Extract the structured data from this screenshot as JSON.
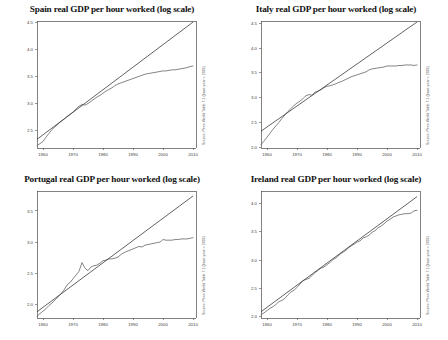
{
  "figure": {
    "layout": "2x2-panel-grid",
    "background": "#ffffff",
    "panel_count": 4
  },
  "chart_data": [
    {
      "type": "line",
      "title": "Spain real GDP per hour worked (log scale)",
      "xlabel": "",
      "ylabel": "",
      "grid": false,
      "legend_position": "none",
      "xlim": [
        1958,
        2011
      ],
      "ylim": [
        2.18,
        4.52
      ],
      "xticks": [
        1960,
        1970,
        1980,
        1990,
        2000,
        2010
      ],
      "xticklabels": [
        "1960",
        "1970",
        "1980",
        "1990",
        "2000",
        "2010"
      ],
      "yticks": [
        2.5,
        3.0,
        3.5,
        4.0,
        4.5
      ],
      "yticklabels": [
        "2.5",
        "3.0",
        "3.5",
        "4.0",
        "4.5"
      ],
      "annotation": "Source: Penn World Table 7.1 (base year = 2005)",
      "series": [
        {
          "name": "Actual log real GDP per hour worked",
          "x": [
            1958,
            1959,
            1960,
            1961,
            1962,
            1963,
            1964,
            1965,
            1966,
            1967,
            1968,
            1969,
            1970,
            1971,
            1972,
            1973,
            1974,
            1975,
            1976,
            1977,
            1978,
            1979,
            1980,
            1981,
            1982,
            1983,
            1984,
            1985,
            1986,
            1987,
            1988,
            1989,
            1990,
            1991,
            1992,
            1993,
            1994,
            1995,
            1996,
            1997,
            1998,
            1999,
            2000,
            2001,
            2002,
            2003,
            2004,
            2005,
            2006,
            2007,
            2008,
            2009,
            2010
          ],
          "values": [
            2.23,
            2.26,
            2.3,
            2.38,
            2.45,
            2.52,
            2.57,
            2.62,
            2.67,
            2.71,
            2.76,
            2.8,
            2.84,
            2.9,
            2.95,
            2.98,
            2.97,
            3.0,
            3.04,
            3.08,
            3.12,
            3.15,
            3.19,
            3.23,
            3.26,
            3.29,
            3.33,
            3.36,
            3.38,
            3.4,
            3.42,
            3.44,
            3.46,
            3.48,
            3.5,
            3.52,
            3.54,
            3.55,
            3.56,
            3.57,
            3.58,
            3.59,
            3.6,
            3.6,
            3.61,
            3.62,
            3.62,
            3.63,
            3.64,
            3.65,
            3.66,
            3.68,
            3.69
          ]
        },
        {
          "name": "Log-linear trend",
          "x": [
            1958,
            2010
          ],
          "values": [
            2.34,
            4.5
          ]
        }
      ]
    },
    {
      "type": "line",
      "title": "Italy real GDP per hour worked (log scale)",
      "xlabel": "",
      "ylabel": "",
      "grid": false,
      "legend_position": "none",
      "xlim": [
        1958,
        2011
      ],
      "ylim": [
        1.98,
        4.55
      ],
      "xticks": [
        1960,
        1970,
        1980,
        1990,
        2000,
        2010
      ],
      "xticklabels": [
        "1960",
        "1970",
        "1980",
        "1990",
        "2000",
        "2010"
      ],
      "yticks": [
        2.0,
        2.5,
        3.0,
        3.5,
        4.0,
        4.5
      ],
      "yticklabels": [
        "2.0",
        "2.5",
        "3.0",
        "3.5",
        "4.0",
        "4.5"
      ],
      "annotation": "Source: Penn World Table 7.1 (base year = 2005)",
      "series": [
        {
          "name": "Actual log real GDP per hour worked",
          "x": [
            1958,
            1959,
            1960,
            1961,
            1962,
            1963,
            1964,
            1965,
            1966,
            1967,
            1968,
            1969,
            1970,
            1971,
            1972,
            1973,
            1974,
            1975,
            1976,
            1977,
            1978,
            1979,
            1980,
            1981,
            1982,
            1983,
            1984,
            1985,
            1986,
            1987,
            1988,
            1989,
            1990,
            1991,
            1992,
            1993,
            1994,
            1995,
            1996,
            1997,
            1998,
            1999,
            2000,
            2001,
            2002,
            2003,
            2004,
            2005,
            2006,
            2007,
            2008,
            2009,
            2010
          ],
          "values": [
            2.05,
            2.12,
            2.2,
            2.28,
            2.36,
            2.43,
            2.5,
            2.58,
            2.65,
            2.72,
            2.78,
            2.84,
            2.89,
            2.93,
            2.98,
            3.04,
            3.06,
            3.05,
            3.11,
            3.13,
            3.16,
            3.2,
            3.23,
            3.24,
            3.26,
            3.28,
            3.31,
            3.33,
            3.36,
            3.39,
            3.42,
            3.44,
            3.46,
            3.48,
            3.5,
            3.52,
            3.56,
            3.58,
            3.59,
            3.6,
            3.61,
            3.62,
            3.64,
            3.64,
            3.64,
            3.64,
            3.65,
            3.65,
            3.66,
            3.66,
            3.66,
            3.65,
            3.66
          ]
        },
        {
          "name": "Log-linear trend",
          "x": [
            1958,
            2010
          ],
          "values": [
            2.32,
            4.53
          ]
        }
      ]
    },
    {
      "type": "line",
      "title": "Portugal real GDP per hour worked (log scale)",
      "xlabel": "",
      "ylabel": "",
      "grid": false,
      "legend_position": "none",
      "xlim": [
        1958,
        2011
      ],
      "ylim": [
        1.78,
        3.82
      ],
      "xticks": [
        1960,
        1970,
        1980,
        1990,
        2000,
        2010
      ],
      "xticklabels": [
        "1960",
        "1970",
        "1980",
        "1990",
        "2000",
        "2010"
      ],
      "yticks": [
        2.0,
        2.5,
        3.0,
        3.5
      ],
      "yticklabels": [
        "2.0",
        "2.5",
        "3.0",
        "3.5"
      ],
      "annotation": "Source: Penn World Table 7.1 (base year = 2005)",
      "series": [
        {
          "name": "Actual log real GDP per hour worked",
          "x": [
            1958,
            1959,
            1960,
            1961,
            1962,
            1963,
            1964,
            1965,
            1966,
            1967,
            1968,
            1969,
            1970,
            1971,
            1972,
            1973,
            1974,
            1975,
            1976,
            1977,
            1978,
            1979,
            1980,
            1981,
            1982,
            1983,
            1984,
            1985,
            1986,
            1987,
            1988,
            1989,
            1990,
            1991,
            1992,
            1993,
            1994,
            1995,
            1996,
            1997,
            1998,
            1999,
            2000,
            2001,
            2002,
            2003,
            2004,
            2005,
            2006,
            2007,
            2008,
            2009,
            2010
          ],
          "values": [
            1.81,
            1.85,
            1.89,
            1.93,
            1.98,
            2.02,
            2.07,
            2.12,
            2.17,
            2.23,
            2.31,
            2.35,
            2.41,
            2.47,
            2.53,
            2.67,
            2.58,
            2.54,
            2.6,
            2.62,
            2.63,
            2.66,
            2.7,
            2.71,
            2.73,
            2.73,
            2.74,
            2.76,
            2.8,
            2.83,
            2.85,
            2.87,
            2.89,
            2.91,
            2.93,
            2.92,
            2.95,
            2.96,
            2.97,
            2.98,
            2.99,
            3.0,
            3.04,
            3.03,
            3.03,
            3.03,
            3.04,
            3.04,
            3.05,
            3.05,
            3.05,
            3.06,
            3.07
          ]
        },
        {
          "name": "Log-linear trend",
          "x": [
            1958,
            2010
          ],
          "values": [
            1.88,
            3.74
          ]
        }
      ]
    },
    {
      "type": "line",
      "title": "Ireland real GDP per hour worked (log scale)",
      "xlabel": "",
      "ylabel": "",
      "grid": false,
      "legend_position": "none",
      "xlim": [
        1958,
        2011
      ],
      "ylim": [
        1.98,
        4.22
      ],
      "xticks": [
        1960,
        1970,
        1980,
        1990,
        2000,
        2010
      ],
      "xticklabels": [
        "1960",
        "1970",
        "1980",
        "1990",
        "2000",
        "2010"
      ],
      "yticks": [
        2.0,
        2.5,
        3.0,
        3.5,
        4.0
      ],
      "yticklabels": [
        "2.0",
        "2.5",
        "3.0",
        "3.5",
        "4.0"
      ],
      "annotation": "Source: Penn World Table 7.1 (base year = 2005)",
      "series": [
        {
          "name": "Actual log real GDP per hour worked",
          "x": [
            1958,
            1959,
            1960,
            1961,
            1962,
            1963,
            1964,
            1965,
            1966,
            1967,
            1968,
            1969,
            1970,
            1971,
            1972,
            1973,
            1974,
            1975,
            1976,
            1977,
            1978,
            1979,
            1980,
            1981,
            1982,
            1983,
            1984,
            1985,
            1986,
            1987,
            1988,
            1989,
            1990,
            1991,
            1992,
            1993,
            1994,
            1995,
            1996,
            1997,
            1998,
            1999,
            2000,
            2001,
            2002,
            2003,
            2004,
            2005,
            2006,
            2007,
            2008,
            2009,
            2010
          ],
          "values": [
            2.04,
            2.07,
            2.11,
            2.15,
            2.18,
            2.22,
            2.27,
            2.29,
            2.33,
            2.39,
            2.44,
            2.47,
            2.52,
            2.58,
            2.64,
            2.66,
            2.68,
            2.73,
            2.78,
            2.82,
            2.86,
            2.88,
            2.92,
            2.96,
            3.01,
            3.04,
            3.09,
            3.13,
            3.16,
            3.21,
            3.25,
            3.28,
            3.32,
            3.34,
            3.39,
            3.41,
            3.44,
            3.49,
            3.52,
            3.57,
            3.6,
            3.64,
            3.69,
            3.72,
            3.76,
            3.78,
            3.8,
            3.81,
            3.82,
            3.82,
            3.83,
            3.87,
            3.88
          ]
        },
        {
          "name": "Log-linear trend",
          "x": [
            1958,
            2010
          ],
          "values": [
            2.09,
            4.12
          ]
        }
      ]
    }
  ]
}
